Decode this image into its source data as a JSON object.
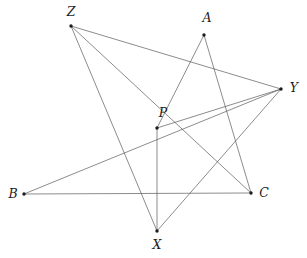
{
  "figure": {
    "width": 307,
    "height": 258,
    "background_color": "#ffffff",
    "line_color": "#5a5a5a",
    "point_color": "#1c1c1c",
    "line_width": 0.7,
    "point_radius": 1.7
  },
  "points": [
    {
      "label": "Z",
      "x": 71,
      "y": 26,
      "label_x": 71,
      "label_y": 12
    },
    {
      "label": "A",
      "x": 204,
      "y": 35,
      "label_x": 207,
      "label_y": 18
    },
    {
      "label": "Y",
      "x": 281,
      "y": 89,
      "label_x": 294,
      "label_y": 88
    },
    {
      "label": "P",
      "x": 157,
      "y": 128,
      "label_x": 163,
      "label_y": 113
    },
    {
      "label": "B",
      "x": 24,
      "y": 194,
      "label_x": 13,
      "label_y": 194
    },
    {
      "label": "C",
      "x": 251,
      "y": 193,
      "label_x": 264,
      "label_y": 193
    },
    {
      "label": "X",
      "x": 157,
      "y": 231,
      "label_x": 157,
      "label_y": 245
    }
  ],
  "segments": [
    {
      "name": "segment-b-c",
      "from": "B",
      "to": "C"
    },
    {
      "name": "segment-b-y",
      "from": "B",
      "to": "Y"
    },
    {
      "name": "segment-a-c",
      "from": "A",
      "to": "C"
    },
    {
      "name": "segment-a-p",
      "from": "A",
      "to": "P"
    },
    {
      "name": "segment-p-y",
      "from": "P",
      "to": "Y"
    },
    {
      "name": "segment-p-x",
      "from": "P",
      "to": "X"
    },
    {
      "name": "segment-z-y",
      "from": "Z",
      "to": "Y"
    },
    {
      "name": "segment-z-c",
      "from": "Z",
      "to": "C"
    },
    {
      "name": "segment-z-x",
      "from": "Z",
      "to": "X"
    },
    {
      "name": "segment-x-y",
      "from": "X",
      "to": "Y"
    }
  ]
}
